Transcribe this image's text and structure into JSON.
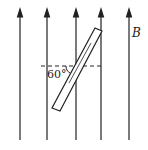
{
  "diagram": {
    "field_label": "B",
    "angle_label": "60°",
    "field_lines_x": [
      20,
      47,
      76,
      101,
      129
    ],
    "colors": {
      "line": "#222222",
      "background": "#ffffff"
    }
  }
}
